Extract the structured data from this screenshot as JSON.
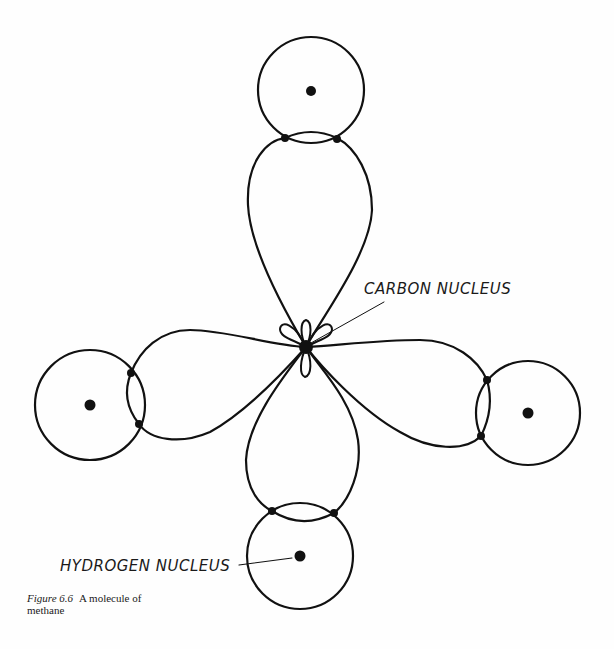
{
  "figure": {
    "caption_number": "Figure 6.6",
    "caption_text": "A molecule of methane"
  },
  "labels": {
    "carbon": "CARBON NUCLEUS",
    "hydrogen": "HYDROGEN NUCLEUS"
  },
  "colors": {
    "ink": "#111111",
    "background": "#fefefe"
  },
  "diagram": {
    "carbon_nucleus": {
      "x": 306,
      "y": 347
    },
    "hydrogen_atoms": [
      {
        "position": "top",
        "x": 311,
        "y": 90,
        "r": 53
      },
      {
        "position": "left",
        "x": 90,
        "y": 405,
        "r": 55
      },
      {
        "position": "right",
        "x": 528,
        "y": 413,
        "r": 52
      },
      {
        "position": "bottom",
        "x": 300,
        "y": 556,
        "r": 53
      }
    ]
  }
}
